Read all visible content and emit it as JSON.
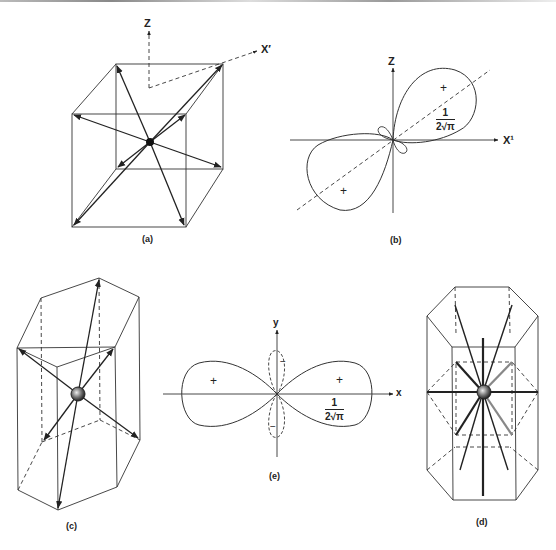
{
  "figure": {
    "panels": [
      {
        "id": "a",
        "caption": "(a)",
        "type": "cube-coordination",
        "axes": {
          "vertical": "Z",
          "diagonal": "X′"
        }
      },
      {
        "id": "b",
        "caption": "(b)",
        "type": "orbital-polar-plot",
        "axes": {
          "vertical": "Z",
          "horizontal": "X¹"
        },
        "lobe_signs": [
          "+",
          "+",
          "−",
          "−"
        ],
        "radius_label": {
          "numerator": "1",
          "denominator": "2√π"
        }
      },
      {
        "id": "c",
        "caption": "(c)",
        "type": "pentagonal-prism-coordination"
      },
      {
        "id": "d",
        "caption": "(d)",
        "type": "hexagonal-prism-coordination"
      },
      {
        "id": "e",
        "caption": "(e)",
        "type": "orbital-polar-plot",
        "axes": {
          "vertical": "y",
          "horizontal": "x"
        },
        "lobe_signs": [
          "+",
          "+",
          "−",
          "−"
        ],
        "radius_label": {
          "numerator": "1",
          "denominator": "2√π"
        }
      }
    ]
  },
  "labels": {
    "a_z": "Z",
    "a_x": "X′",
    "a_cap": "(a)",
    "b_z": "Z",
    "b_x": "X¹",
    "b_cap": "(b)",
    "b_plus1": "+",
    "b_plus2": "+",
    "b_num": "1",
    "b_den": "2√π",
    "c_cap": "(c)",
    "d_cap": "(d)",
    "e_y": "y",
    "e_x": "x",
    "e_cap": "(e)",
    "e_plus1": "+",
    "e_plus2": "+",
    "e_minus1": "−",
    "e_minus2": "−",
    "e_num": "1",
    "e_den": "2√π"
  }
}
